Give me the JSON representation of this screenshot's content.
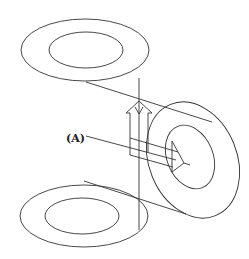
{
  "diagram": {
    "label_a": "(A)",
    "elements": [
      {
        "id": "top-annulus",
        "type": "annulus",
        "orientation": "horizontal"
      },
      {
        "id": "bottom-annulus",
        "type": "annulus",
        "orientation": "horizontal"
      },
      {
        "id": "side-annulus",
        "type": "annulus",
        "orientation": "vertical"
      },
      {
        "id": "up-arrow",
        "type": "hollow-arrow",
        "direction": "up"
      },
      {
        "id": "side-arrow",
        "type": "hollow-arrow",
        "direction": "right"
      },
      {
        "id": "label-a",
        "type": "label",
        "text_ref": "label_a"
      }
    ],
    "colors": {
      "stroke": "#333333",
      "background": "#ffffff"
    }
  }
}
